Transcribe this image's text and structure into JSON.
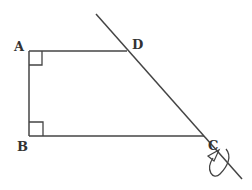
{
  "diagram": {
    "type": "geometry",
    "stroke_color": "#444444",
    "points": {
      "A": {
        "label": "A",
        "x": 29,
        "y": 51
      },
      "B": {
        "label": "B",
        "x": 29,
        "y": 136
      },
      "C": {
        "label": "C",
        "x": 204,
        "y": 136
      },
      "D": {
        "label": "D",
        "x": 127,
        "y": 51
      }
    },
    "right_angles": [
      "A",
      "B"
    ],
    "extended_line": {
      "through": [
        "D",
        "C"
      ],
      "from": [
        96,
        14
      ],
      "to": [
        242,
        179
      ]
    },
    "rotation_marker": {
      "at": "C",
      "symbol": "curved-arrow"
    }
  }
}
